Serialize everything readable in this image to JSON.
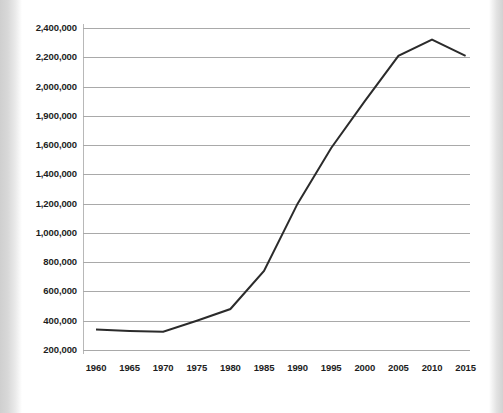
{
  "chart_data": {
    "type": "line",
    "title": "",
    "subtitle": "",
    "xlabel": "",
    "ylabel": "",
    "x": [
      1960,
      1965,
      1970,
      1975,
      1980,
      1985,
      1990,
      1995,
      2000,
      2005,
      2010,
      2015
    ],
    "x_tick_labels": [
      "1960",
      "1965",
      "1970",
      "1975",
      "1980",
      "1985",
      "1990",
      "1995",
      "2000",
      "2005",
      "2010",
      "2015"
    ],
    "y_tick_labels": [
      "2,400,000",
      "2,200,000",
      "2,000,000",
      "1,900,000",
      "1,600,000",
      "1,400,000",
      "1,200,000",
      "1,000,000",
      "800,000",
      "600,000",
      "400,000",
      "200,000"
    ],
    "y_tick_values": [
      2400000,
      2200000,
      2000000,
      1900000,
      1600000,
      1400000,
      1200000,
      1000000,
      800000,
      600000,
      400000,
      200000
    ],
    "ylim": [
      200000,
      2400000
    ],
    "xlim": [
      1960,
      2015
    ],
    "grid": true,
    "legend": null,
    "series": [
      {
        "name": "series-1",
        "color": "#2b2b2b",
        "values": [
          340000,
          330000,
          325000,
          400000,
          480000,
          740000,
          1200000,
          1580000,
          1950000,
          2210000,
          2320000,
          2210000
        ]
      }
    ],
    "annotations": []
  },
  "colors": {
    "line": "#2b2b2b",
    "grid": "#a9a9a9",
    "axis": "#b8b8b8",
    "text": "#1d1d1d",
    "background": "#ffffff"
  }
}
